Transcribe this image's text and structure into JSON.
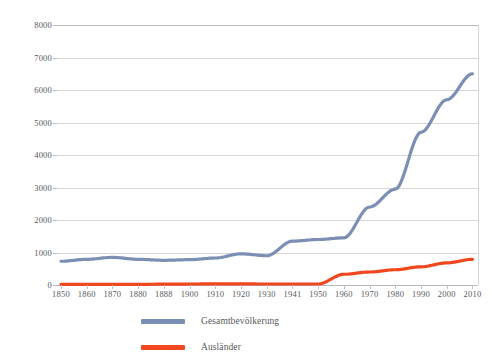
{
  "title_sliver": "",
  "colors": {
    "series_total": "#7b8fb5",
    "series_foreign": "#f0471f",
    "grid": "#d5d6d8",
    "axis": "#b9babc",
    "text": "#58595b",
    "background": "#ffffff"
  },
  "legend": {
    "position": "bottom",
    "entries": [
      {
        "label": "Gesamtbevölkerung",
        "color": "#7b8fb5"
      },
      {
        "label": "Ausländer",
        "color": "#f0471f"
      }
    ]
  },
  "axes": {
    "y_ticks": [
      "8000",
      "7000",
      "6000",
      "5000",
      "4000",
      "3000",
      "2000",
      "1000",
      "0"
    ],
    "x_ticks": [
      "1850",
      "1860",
      "1870",
      "1880",
      "1888",
      "1900",
      "1910",
      "1920",
      "1930",
      "1941",
      "1950",
      "1960",
      "1970",
      "1980",
      "1990",
      "2000",
      "2010"
    ],
    "ylim": [
      0,
      8000
    ],
    "ystep": 1000,
    "grid": true
  },
  "chart_data": {
    "type": "line",
    "title": "",
    "subtitle": "",
    "xlabel": "",
    "ylabel": "",
    "ylim": [
      0,
      8000
    ],
    "ystep": 1000,
    "grid": true,
    "legend_position": "bottom",
    "categories": [
      "1850",
      "1860",
      "1870",
      "1880",
      "1888",
      "1900",
      "1910",
      "1920",
      "1930",
      "1941",
      "1950",
      "1960",
      "1970",
      "1980",
      "1990",
      "2000",
      "2010"
    ],
    "series": [
      {
        "name": "Gesamtbevölkerung",
        "color": "#7b8fb5",
        "values": [
          730,
          790,
          850,
          790,
          760,
          780,
          830,
          960,
          900,
          1350,
          1400,
          1450,
          2400,
          2950,
          4700,
          5700,
          6500
        ]
      },
      {
        "name": "Ausländer",
        "color": "#f0471f",
        "values": [
          20,
          20,
          20,
          20,
          25,
          30,
          35,
          35,
          30,
          30,
          30,
          330,
          400,
          470,
          560,
          680,
          790
        ]
      }
    ]
  }
}
